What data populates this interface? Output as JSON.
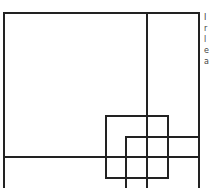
{
  "diagram": {
    "stroke_color": "#222222",
    "stroke_width": 2,
    "outer_frame": {
      "x": 4,
      "y": 13,
      "right": 199,
      "bottom": 188
    },
    "vertical_divider_x": 147,
    "horizontal_divider_y": 157,
    "square_a": {
      "x": 106,
      "y": 116,
      "w": 62,
      "h": 62
    },
    "square_b": {
      "x": 126,
      "y": 137,
      "right": 199,
      "bottom": 188
    }
  },
  "edge_text": {
    "lines": [
      "I",
      "r",
      "l",
      "e",
      "a"
    ]
  }
}
